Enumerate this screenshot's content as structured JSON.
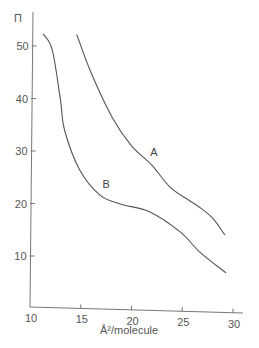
{
  "chart_data": {
    "type": "line",
    "title": "",
    "xlabel": "Å²/molecule",
    "ylabel": "Π",
    "xlim": [
      10,
      30
    ],
    "ylim": [
      0,
      55
    ],
    "xticks": [
      10,
      15,
      20,
      25,
      30
    ],
    "yticks": [
      10,
      20,
      30,
      40,
      50
    ],
    "grid": false,
    "legend": "none (curves labelled inline)",
    "series": [
      {
        "name": "A",
        "x": [
          14.6,
          16.0,
          18.1,
          20.0,
          22.0,
          23.8,
          25.5,
          26.7,
          28.0,
          29.2
        ],
        "y": [
          52.2,
          45.0,
          36.4,
          31.0,
          27.3,
          23.1,
          20.8,
          19.3,
          17.2,
          14.0
        ]
      },
      {
        "name": "B",
        "x": [
          11.3,
          12.2,
          13.0,
          13.4,
          14.9,
          16.9,
          18.9,
          21.8,
          24.8,
          26.7,
          29.3
        ],
        "y": [
          52.3,
          49.2,
          39.7,
          34.0,
          26.4,
          21.6,
          19.9,
          18.4,
          14.6,
          10.8,
          6.8
        ]
      }
    ],
    "annotations": [
      {
        "text": "A",
        "x": 22.2,
        "y": 29.0
      },
      {
        "text": "B",
        "x": 17.5,
        "y": 23.0
      }
    ]
  },
  "labels": {
    "y_axis_symbol": "Π",
    "x_axis_title": "Å²/molecule",
    "curve_a": "A",
    "curve_b": "B"
  }
}
